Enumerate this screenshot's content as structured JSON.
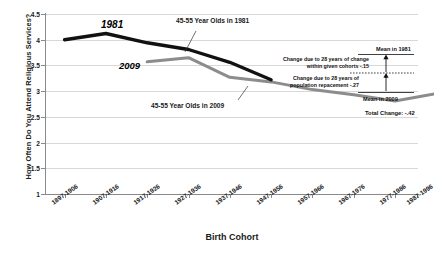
{
  "chart_data": {
    "type": "line",
    "title": "",
    "xlabel": "Birth Cohort",
    "ylabel": "How Often Do You Attend Religious Services?",
    "ylim": [
      1,
      4.5
    ],
    "yticks": [
      "1",
      "1.5",
      "2",
      "2.5",
      "3",
      "3.5",
      "4",
      "4.5"
    ],
    "ytick_values": [
      1,
      1.5,
      2,
      2.5,
      3,
      3.5,
      4,
      4.5
    ],
    "grid": true,
    "legend_position": "inline-annotations",
    "categories": [
      "1897-1906",
      "1907-1916",
      "1917-1926",
      "1927-1936",
      "1937-1946",
      "1947-1956",
      "1957-1966",
      "1967-1976",
      "1977-1986",
      "1987-1996"
    ],
    "series": [
      {
        "name": "45-55 Year Olds in 1981",
        "short_name": "1981",
        "color": "#111111",
        "width": 3.4,
        "values": [
          4.0,
          4.12,
          3.94,
          3.81,
          3.56,
          3.22,
          null,
          null,
          null,
          null
        ]
      },
      {
        "name": "45-55 Year Olds in 2009",
        "short_name": "2009",
        "color": "#8c8c8c",
        "width": 3.0,
        "values": [
          null,
          null,
          3.57,
          3.65,
          3.27,
          3.18,
          3.03,
          2.93,
          2.81,
          2.95
        ]
      }
    ],
    "annotations": [
      {
        "name": "within-cohort-change",
        "line1": "Change due to 28 years of change",
        "line2": "within given cohorts  -.15"
      },
      {
        "name": "population-replacement-change",
        "line1": "Change due to 28 years of",
        "line2": "population repacement  -.27"
      }
    ],
    "markers": {
      "mean_1981_label": "Mean in 1981",
      "mean_2009_label": "Mean in 2009",
      "total_change_label": "Total Change: -.42",
      "mean_1981_value": 3.37,
      "mean_2009_value": 2.95
    },
    "series_labels": {
      "label_1981": "1981",
      "label_2009": "2009",
      "callout_1981": "45-55 Year Olds in 1981",
      "callout_2009": "45-55 Year Olds in 2009"
    }
  }
}
